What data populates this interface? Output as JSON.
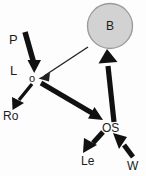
{
  "diagram": {
    "type": "path-diagram",
    "background_color": "#fdfdfd",
    "nodes": [
      {
        "id": "P",
        "label": "P",
        "shape": "text",
        "x": 14,
        "y": 39
      },
      {
        "id": "L",
        "label": "L",
        "shape": "text",
        "x": 14,
        "y": 70
      },
      {
        "id": "o",
        "label": "o",
        "shape": "text",
        "x": 33,
        "y": 78
      },
      {
        "id": "Ro",
        "label": "Ro",
        "shape": "text",
        "x": 12,
        "y": 116
      },
      {
        "id": "B",
        "label": "B",
        "shape": "circle",
        "x": 110,
        "y": 26,
        "radius": 23,
        "fill": "#d2d2d2",
        "stroke": "#9a9a9a"
      },
      {
        "id": "OS",
        "label": "OS",
        "shape": "text",
        "x": 110,
        "y": 128
      },
      {
        "id": "Le",
        "label": "Le",
        "shape": "text",
        "x": 88,
        "y": 161
      },
      {
        "id": "W",
        "label": "W",
        "shape": "text",
        "x": 132,
        "y": 166
      }
    ],
    "edges": [
      {
        "from": "P",
        "to": "o",
        "weight": "thick",
        "color": "#111111"
      },
      {
        "from": "B",
        "to": "o",
        "weight": "thin",
        "color": "#222222"
      },
      {
        "from": "o",
        "to": "Ro",
        "weight": "medium",
        "color": "#111111"
      },
      {
        "from": "o",
        "to": "OS",
        "weight": "thick",
        "color": "#111111"
      },
      {
        "from": "OS",
        "to": "B",
        "weight": "thick",
        "color": "#111111"
      },
      {
        "from": "OS",
        "to": "Le",
        "weight": "thick",
        "color": "#111111"
      },
      {
        "from": "W",
        "to": "OS",
        "weight": "thick",
        "color": "#111111"
      }
    ]
  }
}
